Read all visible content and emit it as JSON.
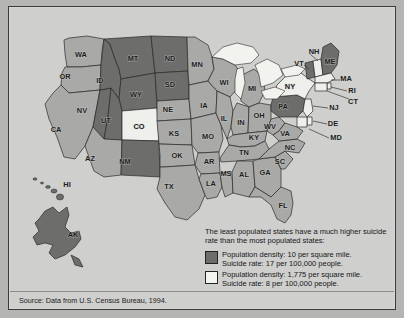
{
  "figure": {
    "kind": "choropleth-map",
    "region": "United States",
    "background_color": "#cfcfcd",
    "frame_color": "#3a3a38"
  },
  "colors": {
    "low_density": "#6d6d6b",
    "mid_density": "#a9a9a7",
    "high_density": "#efefec",
    "water": "#f2f2ef",
    "outline": "#2a2a28",
    "label": "#1c1c1c"
  },
  "legend": {
    "intro_line1": "The least populated states have a much higher suicide",
    "intro_line2": "rate than the most populated states:",
    "entries": [
      {
        "swatch_color": "#6d6d6b",
        "line1": "Population density: 10 per square mile.",
        "line2": "Suicide rate: 17 per 100,000 people.",
        "population_density": 10,
        "population_density_unit": "per square mile",
        "suicide_rate": 17,
        "suicide_rate_unit": "per 100,000 people",
        "group": "least populated states"
      },
      {
        "swatch_color": "#f4f4f1",
        "line1": "Population density: 1,775 per square mile.",
        "line2": "Suicide rate: 8 per 100,000 people.",
        "population_density": 1775,
        "population_density_unit": "per square mile",
        "suicide_rate": 8,
        "suicide_rate_unit": "per 100,000 people",
        "group": "most populated states"
      }
    ]
  },
  "source": {
    "text": "Source: Data from U.S. Census Bureau, 1994."
  },
  "chart_data": {
    "type": "map",
    "title": "",
    "categories": [
      "low_density",
      "mid_density",
      "high_density"
    ],
    "legend_position": "bottom-right",
    "states": [
      {
        "code": "WA",
        "shade": "mid",
        "lx": 72,
        "ly": 48
      },
      {
        "code": "OR",
        "shade": "mid",
        "lx": 56,
        "ly": 70
      },
      {
        "code": "CA",
        "shade": "mid",
        "lx": 47,
        "ly": 123
      },
      {
        "code": "NV",
        "shade": "low",
        "lx": 73,
        "ly": 104
      },
      {
        "code": "ID",
        "shade": "low",
        "lx": 91,
        "ly": 74
      },
      {
        "code": "MT",
        "shade": "low",
        "lx": 124,
        "ly": 52
      },
      {
        "code": "WY",
        "shade": "low",
        "lx": 127,
        "ly": 88
      },
      {
        "code": "UT",
        "shade": "low",
        "lx": 97,
        "ly": 114
      },
      {
        "code": "AZ",
        "shade": "mid",
        "lx": 81,
        "ly": 152
      },
      {
        "code": "CO",
        "shade": "high",
        "lx": 130,
        "ly": 120
      },
      {
        "code": "NM",
        "shade": "low",
        "lx": 116,
        "ly": 155
      },
      {
        "code": "ND",
        "shade": "low",
        "lx": 161,
        "ly": 52
      },
      {
        "code": "SD",
        "shade": "low",
        "lx": 161,
        "ly": 78
      },
      {
        "code": "NE",
        "shade": "mid",
        "lx": 159,
        "ly": 103
      },
      {
        "code": "KS",
        "shade": "mid",
        "lx": 165,
        "ly": 127
      },
      {
        "code": "OK",
        "shade": "mid",
        "lx": 168,
        "ly": 149
      },
      {
        "code": "TX",
        "shade": "mid",
        "lx": 160,
        "ly": 180
      },
      {
        "code": "MN",
        "shade": "mid",
        "lx": 188,
        "ly": 58
      },
      {
        "code": "IA",
        "shade": "mid",
        "lx": 195,
        "ly": 99
      },
      {
        "code": "MO",
        "shade": "mid",
        "lx": 199,
        "ly": 130
      },
      {
        "code": "AR",
        "shade": "mid",
        "lx": 200,
        "ly": 155
      },
      {
        "code": "LA",
        "shade": "mid",
        "lx": 202,
        "ly": 177
      },
      {
        "code": "WI",
        "shade": "mid",
        "lx": 215,
        "ly": 76
      },
      {
        "code": "IL",
        "shade": "mid",
        "lx": 215,
        "ly": 112
      },
      {
        "code": "MS",
        "shade": "mid",
        "lx": 217,
        "ly": 167
      },
      {
        "code": "MI",
        "shade": "mid",
        "lx": 243,
        "ly": 82
      },
      {
        "code": "IN",
        "shade": "mid",
        "lx": 232,
        "ly": 116
      },
      {
        "code": "TN",
        "shade": "mid",
        "lx": 235,
        "ly": 146
      },
      {
        "code": "AL",
        "shade": "mid",
        "lx": 235,
        "ly": 168
      },
      {
        "code": "OH",
        "shade": "mid",
        "lx": 250,
        "ly": 109
      },
      {
        "code": "KY",
        "shade": "mid",
        "lx": 245,
        "ly": 131
      },
      {
        "code": "GA",
        "shade": "mid",
        "lx": 256,
        "ly": 166
      },
      {
        "code": "FL",
        "shade": "mid",
        "lx": 274,
        "ly": 199
      },
      {
        "code": "SC",
        "shade": "mid",
        "lx": 271,
        "ly": 155
      },
      {
        "code": "NC",
        "shade": "mid",
        "lx": 281,
        "ly": 141
      },
      {
        "code": "WV",
        "shade": "mid",
        "lx": 261,
        "ly": 120
      },
      {
        "code": "VA",
        "shade": "mid",
        "lx": 276,
        "ly": 127
      },
      {
        "code": "PA",
        "shade": "low",
        "lx": 274,
        "ly": 100
      },
      {
        "code": "NY",
        "shade": "high",
        "lx": 281,
        "ly": 80
      },
      {
        "code": "VT",
        "shade": "low",
        "lx": 290,
        "ly": 57
      },
      {
        "code": "NH",
        "shade": "high",
        "lx": 305,
        "ly": 45
      },
      {
        "code": "ME",
        "shade": "low",
        "lx": 321,
        "ly": 55
      },
      {
        "code": "MA",
        "shade": "high",
        "lx": 337,
        "ly": 72
      },
      {
        "code": "RI",
        "shade": "high",
        "lx": 343,
        "ly": 84
      },
      {
        "code": "CT",
        "shade": "high",
        "lx": 344,
        "ly": 95
      },
      {
        "code": "NJ",
        "shade": "high",
        "lx": 325,
        "ly": 101
      },
      {
        "code": "DE",
        "shade": "high",
        "lx": 324,
        "ly": 117
      },
      {
        "code": "MD",
        "shade": "high",
        "lx": 327,
        "ly": 131
      },
      {
        "code": "AK",
        "shade": "low",
        "lx": 64,
        "ly": 228
      },
      {
        "code": "HI",
        "shade": "mid",
        "lx": 58,
        "ly": 178
      }
    ]
  }
}
